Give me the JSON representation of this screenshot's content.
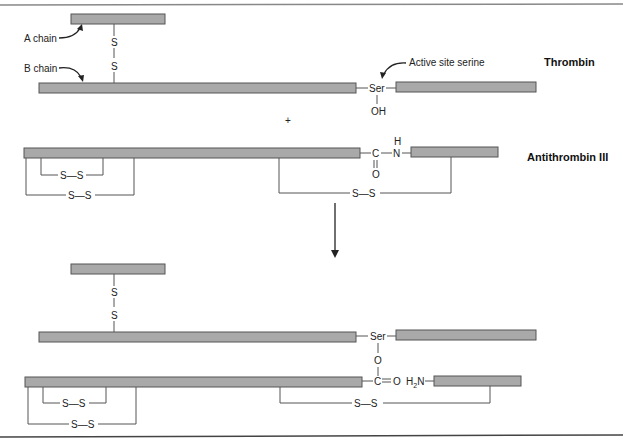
{
  "figure": {
    "thrombin": {
      "title": "Thrombin",
      "a_chain_label": "A chain",
      "b_chain_label": "B chain",
      "active_site_label": "Active site serine",
      "disulfide_atoms": [
        "S",
        "S"
      ],
      "serine": "Ser",
      "hydroxyl": "OH"
    },
    "plus_sign": "+",
    "antithrombin": {
      "title": "Antithrombin III",
      "carbon": "C",
      "oxygen": "O",
      "nitrogen": "N",
      "hydrogen": "H",
      "disulfide_label": "S—S"
    },
    "product": {
      "disulfide_atoms": [
        "S",
        "S"
      ],
      "serine": "Ser",
      "ester_oxygen": "O",
      "carbon": "C",
      "carbonyl": "=O",
      "amine": "H₂N",
      "disulfide_label": "S—S"
    },
    "colors": {
      "chain_fill": "#a9a9a9",
      "chain_stroke": "#555555",
      "line": "#555555",
      "text": "#222222"
    }
  }
}
